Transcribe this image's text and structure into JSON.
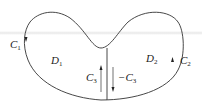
{
  "diagram": {
    "type": "region-decomposition",
    "labels": {
      "C1": {
        "main": "C",
        "sub": "1"
      },
      "C2": {
        "main": "C",
        "sub": "2"
      },
      "C3": {
        "main": "C",
        "sub": "3"
      },
      "negC3": {
        "prefix": "−",
        "main": "C",
        "sub": "3"
      },
      "D1": {
        "main": "D",
        "sub": "1"
      },
      "D2": {
        "main": "D",
        "sub": "2"
      }
    },
    "colors": {
      "stroke": "#333333",
      "band": "#e8e8e8"
    }
  }
}
